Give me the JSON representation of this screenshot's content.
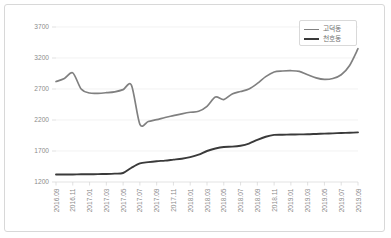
{
  "chart_data": {
    "type": "line",
    "title": "",
    "xlabel": "",
    "ylabel": "",
    "ylim": [
      1200,
      3700
    ],
    "yticks": [
      1200,
      1700,
      2200,
      2700,
      3200,
      3700
    ],
    "grid": true,
    "legend_position": "top-right",
    "x": [
      "2016.09",
      "2016.10",
      "2016.11",
      "2016.12",
      "2017.01",
      "2017.02",
      "2017.03",
      "2017.04",
      "2017.05",
      "2017.06",
      "2017.07",
      "2017.08",
      "2017.09",
      "2017.10",
      "2017.11",
      "2017.12",
      "2018.01",
      "2018.02",
      "2018.03",
      "2018.04",
      "2018.05",
      "2018.06",
      "2018.07",
      "2018.08",
      "2018.09",
      "2018.10",
      "2018.11",
      "2018.12",
      "2019.01",
      "2019.02",
      "2019.03",
      "2019.04",
      "2019.05",
      "2019.06",
      "2019.07",
      "2019.08",
      "2019.09"
    ],
    "xtick_labels": [
      "2016.09",
      "2016.11",
      "2017.01",
      "2017.03",
      "2017.05",
      "2017.07",
      "2017.09",
      "2017.11",
      "2018.01",
      "2018.03",
      "2018.05",
      "2018.07",
      "2018.09",
      "2018.11",
      "2019.01",
      "2019.03",
      "2019.05",
      "2019.07",
      "2019.09"
    ],
    "series": [
      {
        "name": "고덕동",
        "color": "#808080",
        "values": [
          2820,
          2870,
          2960,
          2700,
          2635,
          2630,
          2640,
          2655,
          2690,
          2760,
          2130,
          2175,
          2205,
          2240,
          2270,
          2300,
          2325,
          2340,
          2420,
          2570,
          2530,
          2620,
          2660,
          2700,
          2790,
          2900,
          2975,
          2990,
          2995,
          2985,
          2930,
          2880,
          2855,
          2870,
          2930,
          3080,
          3350
        ]
      },
      {
        "name": "천호동",
        "color": "#3a3a3a",
        "values": [
          1320,
          1320,
          1322,
          1325,
          1325,
          1327,
          1330,
          1335,
          1345,
          1430,
          1500,
          1520,
          1535,
          1545,
          1560,
          1575,
          1600,
          1640,
          1700,
          1740,
          1765,
          1770,
          1785,
          1820,
          1880,
          1930,
          1960,
          1963,
          1965,
          1968,
          1970,
          1975,
          1980,
          1985,
          1990,
          1995,
          2000
        ]
      }
    ]
  },
  "legend": {
    "items": [
      {
        "label": "고덕동"
      },
      {
        "label": "천호동"
      }
    ]
  }
}
